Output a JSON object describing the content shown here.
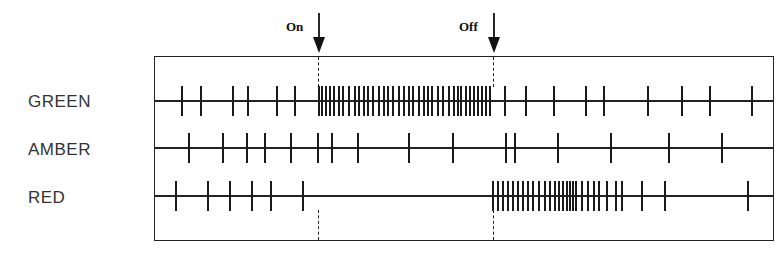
{
  "diagram": {
    "type": "spike-train",
    "markers": {
      "on": {
        "label": "On",
        "x": 319
      },
      "off": {
        "label": "Off",
        "x": 494
      }
    },
    "rows": [
      {
        "label": "GREEN",
        "y": 101,
        "spikes_x": [
          182,
          201,
          233,
          248,
          277,
          295,
          319,
          322,
          326,
          330,
          334,
          339,
          343,
          349,
          355,
          359,
          364,
          368,
          373,
          379,
          384,
          388,
          393,
          399,
          404,
          409,
          413,
          419,
          424,
          428,
          432,
          438,
          443,
          449,
          454,
          458,
          461,
          466,
          470,
          474,
          478,
          482,
          486,
          490,
          505,
          526,
          554,
          586,
          604,
          648,
          682,
          710,
          752
        ]
      },
      {
        "label": "AMBER",
        "y": 148,
        "spikes_x": [
          189,
          223,
          247,
          265,
          291,
          318,
          332,
          358,
          409,
          453,
          506,
          515,
          558,
          611,
          669,
          722
        ]
      },
      {
        "label": "RED",
        "y": 196,
        "spikes_x": [
          176,
          208,
          230,
          252,
          271,
          303,
          493,
          498,
          503,
          508,
          513,
          518,
          523,
          528,
          533,
          539,
          545,
          550,
          555,
          559,
          563,
          567,
          570,
          573,
          576,
          582,
          588,
          594,
          599,
          607,
          616,
          622,
          642,
          665,
          748
        ]
      }
    ]
  }
}
